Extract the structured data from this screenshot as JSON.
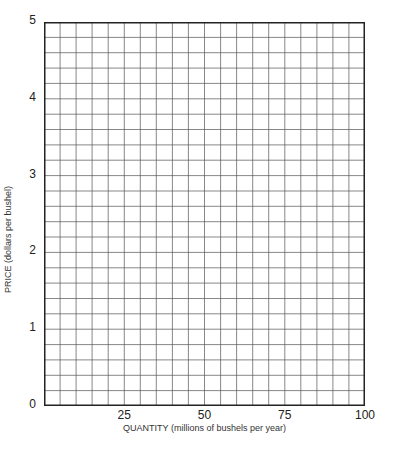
{
  "chart_data": {
    "type": "line",
    "title": "",
    "xlabel": "QUANTITY (millions of bushels per year)",
    "ylabel": "PRICE (dollars per bushel)",
    "xlim": [
      0,
      100
    ],
    "ylim": [
      0,
      5
    ],
    "x_ticks": [
      "25",
      "50",
      "75",
      "100"
    ],
    "x_tick_values": [
      25,
      50,
      75,
      100
    ],
    "y_ticks": [
      "0",
      "1",
      "2",
      "3",
      "4",
      "5"
    ],
    "y_tick_values": [
      0,
      1,
      2,
      3,
      4,
      5
    ],
    "grid": true,
    "grid_columns": 20,
    "grid_rows": 25,
    "series": [],
    "legend": null
  },
  "colors": {
    "grid_line": "#555555",
    "axis_line": "#222222",
    "background": "#ffffff"
  }
}
